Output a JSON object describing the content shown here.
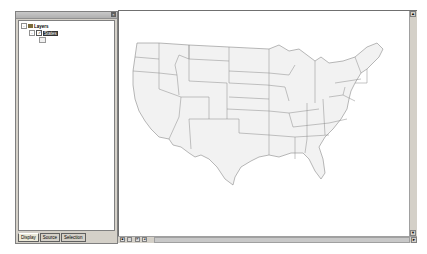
{
  "toc": {
    "title": "",
    "root": {
      "label": "Layers",
      "expander": "-",
      "icon": "layers-icon"
    },
    "layer": {
      "label": "States",
      "expander": "-",
      "checked": true,
      "check": "✓"
    },
    "tabs": [
      {
        "label": "Display",
        "active": true
      },
      {
        "label": "Source",
        "active": false
      },
      {
        "label": "Selection",
        "active": false
      }
    ],
    "close": "×"
  },
  "map": {
    "fill": "#f2f2f2",
    "stroke": "#8a8a8a",
    "background": "#ffffff"
  },
  "scrollbars": {
    "up": "▲",
    "down": "▼",
    "right": "►",
    "left": "◄"
  },
  "view_buttons": [
    "◙",
    "□",
    "⟳",
    "◄"
  ]
}
